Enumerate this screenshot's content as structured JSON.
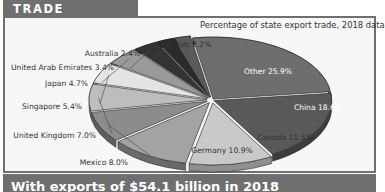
{
  "header": {
    "title": "TRADE PARTNERS"
  },
  "chart_data": {
    "type": "pie",
    "title": "TRADE PARTNERS",
    "subtitle": "Percentage of state export trade, 2018 data",
    "unit": "%",
    "slices": [
      {
        "label": "Other",
        "value": 25.9,
        "text": "Other 25.9%",
        "color": "#6e6e6e",
        "side": "#4a4a4a"
      },
      {
        "label": "China",
        "value": 18.6,
        "text": "China 18.6%",
        "color": "#595959",
        "side": "#3d3d3d"
      },
      {
        "label": "Canada",
        "value": 11.5,
        "text": "Canada 11.5%",
        "color": "#c9c9c9",
        "side": "#8f8f8f"
      },
      {
        "label": "Germany",
        "value": 10.9,
        "text": "Germany 10.9%",
        "color": "#a3a3a3",
        "side": "#6a6a6a"
      },
      {
        "label": "Mexico",
        "value": 8.0,
        "text": "Mexico 8.0%",
        "color": "#8c8c8c",
        "side": "#5e5e5e"
      },
      {
        "label": "United Kingdom",
        "value": 7.0,
        "text": "United Kingdom 7.0%",
        "color": "#bdbdbd",
        "side": "#858585"
      },
      {
        "label": "Singapore",
        "value": 5.4,
        "text": "Singapore 5.4%",
        "color": "#e4e4e4",
        "side": "#a0a0a0"
      },
      {
        "label": "Japan",
        "value": 4.7,
        "text": "Japan 4.7%",
        "color": "#9a9a9a",
        "side": "#666666"
      },
      {
        "label": "United Arab Emirates",
        "value": 3.4,
        "text": "United Arab Emirates 3.4%",
        "color": "#333333",
        "side": "#1e1e1e"
      },
      {
        "label": "Australia",
        "value": 2.4,
        "text": "Australia 2.4%",
        "color": "#2a2a2a",
        "side": "#151515"
      },
      {
        "label": "Belgium",
        "value": 2.2,
        "text": "Belgium 2.2%",
        "color": "#5a5a5a",
        "side": "#333333"
      }
    ],
    "legend": "none",
    "labels_position": "outside with leader lines (inside for Other, China, Canada, Germany)"
  },
  "banner": {
    "text": "With exports of $54.1 billion in 2018"
  }
}
